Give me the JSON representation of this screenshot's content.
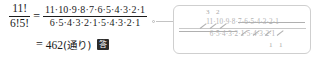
{
  "main": {
    "left_fraction": {
      "numerator": "11!",
      "denominator": "6!5!"
    },
    "equals_sign": "=",
    "expanded_fraction": {
      "numerator": "11·10·9·8·7·6·5·4·3·2·1",
      "denominator": "6·5·4·3·2·1·5·4·3·2·1"
    },
    "result": {
      "equals_sign": "=",
      "value": "462",
      "unit": "(通り)",
      "answer_badge": "答"
    }
  },
  "callout": {
    "fraction": {
      "numerator": "11·10·9·8·7·6·5·4·3·2·1",
      "denominator": "6·5·4·3·2·1·5·4·3·2·1"
    },
    "top_digits": [
      "3",
      "2"
    ],
    "bottom_digits": [
      "1",
      "1"
    ]
  },
  "colors": {
    "ink": "#1b1b1b",
    "faded_ink": "#b4b4b4",
    "callout_border": "#cfcfcf",
    "connector": "#c3c3c3",
    "badge_bg": "#2b2b2b"
  }
}
